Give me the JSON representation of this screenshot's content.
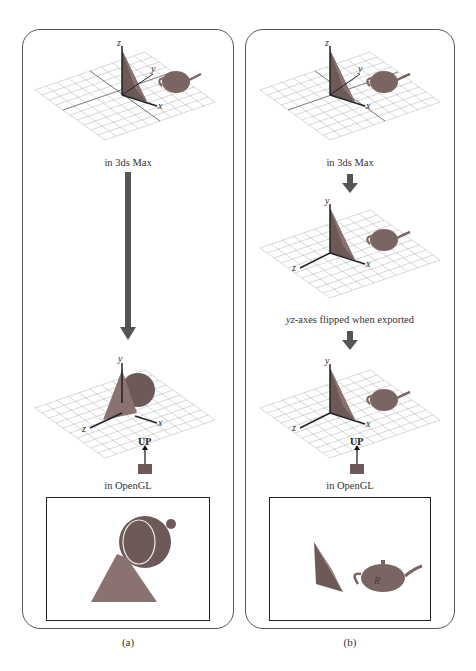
{
  "figure": {
    "panels": [
      {
        "id": "a",
        "label": "(a)",
        "stages": [
          {
            "caption": "in 3ds Max",
            "axes": {
              "vertical": "z",
              "depth": "y",
              "horizontal": "x"
            }
          },
          {
            "caption": "in OpenGL",
            "axes": {
              "vertical": "y",
              "toward_viewer": "z",
              "horizontal": "x"
            },
            "camera_label": "UP"
          }
        ],
        "render_view": "teapot seen from above with triangle in front"
      },
      {
        "id": "b",
        "label": "(b)",
        "stages": [
          {
            "caption": "in 3ds Max",
            "axes": {
              "vertical": "z",
              "depth": "y",
              "horizontal": "x"
            }
          },
          {
            "caption_italic": "yz",
            "caption": "-axes flipped when exported",
            "axes": {
              "vertical": "y",
              "toward_viewer": "z",
              "horizontal": "x"
            }
          },
          {
            "caption": "in OpenGL",
            "axes": {
              "vertical": "y",
              "toward_viewer": "z",
              "horizontal": "x"
            },
            "camera_label": "UP"
          }
        ],
        "render_view": "triangle and teapot with letter R"
      }
    ],
    "teapot_letter": "R",
    "colors": {
      "object": "#7b6563",
      "object_dark": "#5a4644",
      "arrow": "#555555",
      "grid": "#b8b8b8",
      "border": "#555555"
    }
  }
}
